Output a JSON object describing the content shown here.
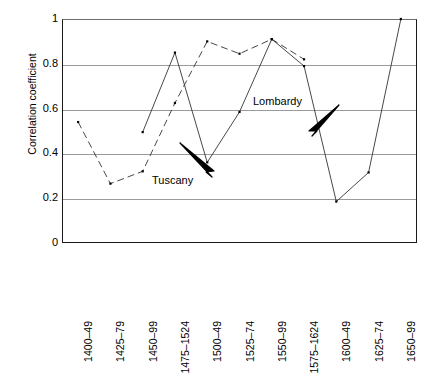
{
  "chart_data": {
    "type": "line",
    "title": "",
    "xlabel": "",
    "ylabel": "Correlation coefficient",
    "ylim": [
      0,
      1
    ],
    "yticks": [
      "0",
      "0.2",
      "0.4",
      "0.6",
      "0.8",
      "1"
    ],
    "ytick_values": [
      0,
      0.2,
      0.4,
      0.6,
      0.8,
      1
    ],
    "grid": "horizontal",
    "legend_position": "inline-annotations",
    "categories": [
      "1400–49",
      "1425–79",
      "1450–99",
      "1475–1524",
      "1500–49",
      "1525–74",
      "1550–99",
      "1575–1624",
      "1600–49",
      "1625–74",
      "1650–99"
    ],
    "series": [
      {
        "name": "Tuscany",
        "style": "dashed",
        "color": "#333333",
        "x": [
          "1400–49",
          "1425–79",
          "1450–99",
          "1475–1524",
          "1500–49",
          "1525–74",
          "1550–99",
          "1575–1624"
        ],
        "values": [
          0.54,
          0.265,
          0.32,
          0.625,
          0.9,
          0.845,
          0.91,
          0.82
        ]
      },
      {
        "name": "Lombardy",
        "style": "solid",
        "color": "#333333",
        "x": [
          "1450–99",
          "1475–1524",
          "1500–49",
          "1525–74",
          "1550–99",
          "1575–1624",
          "1600–49",
          "1625–74",
          "1650–99"
        ],
        "values": [
          0.495,
          0.85,
          0.36,
          0.585,
          0.91,
          0.79,
          0.185,
          0.315,
          1.0
        ]
      }
    ],
    "annotations": [
      {
        "label": "Tuscany",
        "points_to_series": "Tuscany"
      },
      {
        "label": "Lombardy",
        "points_to_series": "Lombardy"
      }
    ]
  }
}
